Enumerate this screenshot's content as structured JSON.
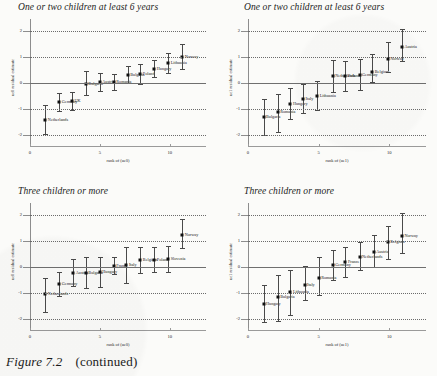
{
  "caption": {
    "figure": "Figure 7.2",
    "note": "(continued)"
  },
  "axis_defaults": {
    "y_ticks": [
      "2",
      "1",
      "0",
      "-1",
      "-2"
    ],
    "y_values": [
      2,
      1,
      0,
      -1,
      -2
    ],
    "x_ticks": [
      "0",
      "5",
      "10"
    ],
    "x_values": [
      0,
      5,
      10
    ]
  },
  "chart_data": [
    {
      "type": "scatter",
      "panel": "top-left",
      "title": "One or two children at least 6 years",
      "xlabel": "rank of (ue0)",
      "ylabel": "ue0 residual estimate",
      "xlim": [
        0,
        12.6
      ],
      "ylim": [
        -2.45,
        2.45
      ],
      "grid": true,
      "gridlines": [
        2,
        1,
        -1,
        -2
      ],
      "zero_line": 0,
      "points": [
        {
          "label": "Netherlands",
          "x": 1.1,
          "y": -1.42,
          "lo": -1.96,
          "hi": -0.86
        },
        {
          "label": "Germany",
          "x": 2.1,
          "y": -0.72,
          "lo": -1.07,
          "hi": -0.37
        },
        {
          "label": "UK",
          "x": 3.0,
          "y": -0.7,
          "lo": -1.03,
          "hi": -0.36
        },
        {
          "label": "Bulgaria",
          "x": 4.0,
          "y": -0.02,
          "lo": -0.47,
          "hi": 0.47
        },
        {
          "label": "Austria",
          "x": 5.0,
          "y": 0.02,
          "lo": -0.32,
          "hi": 0.37
        },
        {
          "label": "Romania",
          "x": 6.0,
          "y": 0.04,
          "lo": -0.26,
          "hi": 0.34
        },
        {
          "label": "Bulgaria2",
          "x": 7.0,
          "y": 0.32,
          "lo": 0.0,
          "hi": 0.66
        },
        {
          "label": "Poland",
          "x": 7.9,
          "y": 0.36,
          "lo": -0.02,
          "hi": 0.74
        },
        {
          "label": "Hungary",
          "x": 8.9,
          "y": 0.54,
          "lo": 0.22,
          "hi": 0.88
        },
        {
          "label": "Lithuania",
          "x": 9.9,
          "y": 0.78,
          "lo": 0.4,
          "hi": 1.16
        },
        {
          "label": "Norway",
          "x": 10.9,
          "y": 0.98,
          "lo": 0.52,
          "hi": 1.48
        }
      ]
    },
    {
      "type": "scatter",
      "panel": "top-right",
      "title": "One or two children at least 6 years",
      "xlabel": "rank of (ue1)",
      "ylabel": "ue1 residual estimate",
      "xlim": [
        0,
        12.6
      ],
      "ylim": [
        -2.45,
        2.45
      ],
      "grid": true,
      "gridlines": [
        2,
        1,
        -1,
        -2
      ],
      "zero_line": 0,
      "points": [
        {
          "label": "Bulgaria",
          "x": 1.1,
          "y": -1.32,
          "lo": -1.98,
          "hi": -0.62
        },
        {
          "label": "Romania",
          "x": 2.1,
          "y": -1.12,
          "lo": -1.86,
          "hi": -0.42
        },
        {
          "label": "Hungary",
          "x": 3.0,
          "y": -0.8,
          "lo": -1.38,
          "hi": -0.18
        },
        {
          "label": "Italy",
          "x": 3.9,
          "y": -0.62,
          "lo": -1.16,
          "hi": -0.04
        },
        {
          "label": "Lithuania",
          "x": 4.9,
          "y": -0.5,
          "lo": -1.04,
          "hi": 0.06
        },
        {
          "label": "Netherlands",
          "x": 6.0,
          "y": 0.26,
          "lo": -0.34,
          "hi": 0.88
        },
        {
          "label": "Poland",
          "x": 6.9,
          "y": 0.26,
          "lo": -0.32,
          "hi": 0.86
        },
        {
          "label": "Germany",
          "x": 7.9,
          "y": 0.3,
          "lo": -0.26,
          "hi": 0.92
        },
        {
          "label": "Belgium",
          "x": 8.8,
          "y": 0.42,
          "lo": 0.02,
          "hi": 1.12
        },
        {
          "label": "Norway",
          "x": 9.9,
          "y": 0.92,
          "lo": 0.44,
          "hi": 1.58
        },
        {
          "label": "Austria",
          "x": 10.9,
          "y": 1.36,
          "lo": 0.86,
          "hi": 2.06
        }
      ]
    },
    {
      "type": "scatter",
      "panel": "bottom-left",
      "title": "Three children or more",
      "xlabel": "rank of (ue0)",
      "ylabel": "ue0 residual estimate",
      "xlim": [
        0,
        12.6
      ],
      "ylim": [
        -2.45,
        2.45
      ],
      "grid": true,
      "gridlines": [
        2,
        1,
        -1,
        -2
      ],
      "zero_line": 0,
      "points": [
        {
          "label": "Netherlands",
          "x": 1.1,
          "y": -1.04,
          "lo": -1.72,
          "hi": -0.42
        },
        {
          "label": "Germany",
          "x": 2.1,
          "y": -0.66,
          "lo": -1.12,
          "hi": -0.2
        },
        {
          "label": "Austria",
          "x": 3.1,
          "y": -0.24,
          "lo": -0.74,
          "hi": 0.3
        },
        {
          "label": "Bulgaria",
          "x": 4.0,
          "y": -0.22,
          "lo": -0.82,
          "hi": 0.4
        },
        {
          "label": "Hungary",
          "x": 5.0,
          "y": -0.18,
          "lo": -0.76,
          "hi": 0.4
        },
        {
          "label": "France",
          "x": 6.0,
          "y": 0.04,
          "lo": -0.28,
          "hi": 0.38
        },
        {
          "label": "Italy",
          "x": 6.9,
          "y": 0.06,
          "lo": -0.62,
          "hi": 0.76
        },
        {
          "label": "Belgium",
          "x": 7.9,
          "y": 0.26,
          "lo": -0.22,
          "hi": 0.76
        },
        {
          "label": "Poland",
          "x": 8.9,
          "y": 0.28,
          "lo": -0.2,
          "hi": 0.78
        },
        {
          "label": "Slovenia",
          "x": 9.9,
          "y": 0.3,
          "lo": -0.18,
          "hi": 0.82
        },
        {
          "label": "Norway",
          "x": 10.9,
          "y": 1.22,
          "lo": 0.74,
          "hi": 1.82
        }
      ]
    },
    {
      "type": "scatter",
      "panel": "bottom-right",
      "title": "Three children or more",
      "xlabel": "rank of (ue1)",
      "ylabel": "ue1 residual estimate",
      "xlim": [
        0,
        12.6
      ],
      "ylim": [
        -2.45,
        2.45
      ],
      "grid": true,
      "gridlines": [
        2,
        1,
        -1,
        -2
      ],
      "zero_line": 0,
      "points": [
        {
          "label": "Hungary",
          "x": 1.1,
          "y": -1.42,
          "lo": -2.12,
          "hi": -0.7
        },
        {
          "label": "Bulgaria",
          "x": 2.1,
          "y": -1.16,
          "lo": -2.06,
          "hi": -0.3
        },
        {
          "label": "Lithuania",
          "x": 3.0,
          "y": -0.96,
          "lo": -1.84,
          "hi": -0.12
        },
        {
          "label": "Italy",
          "x": 4.0,
          "y": -0.7,
          "lo": -1.28,
          "hi": 0.02
        },
        {
          "label": "Romania",
          "x": 5.0,
          "y": -0.44,
          "lo": -1.08,
          "hi": 0.4
        },
        {
          "label": "Germany",
          "x": 6.0,
          "y": 0.08,
          "lo": -0.48,
          "hi": 0.64
        },
        {
          "label": "France",
          "x": 6.9,
          "y": 0.2,
          "lo": -0.38,
          "hi": 0.78
        },
        {
          "label": "Netherlands",
          "x": 7.9,
          "y": 0.4,
          "lo": -0.12,
          "hi": 0.96
        },
        {
          "label": "Austria",
          "x": 8.9,
          "y": 0.58,
          "lo": 0.0,
          "hi": 1.22
        },
        {
          "label": "Belgium",
          "x": 9.9,
          "y": 0.94,
          "lo": 0.3,
          "hi": 1.56
        },
        {
          "label": "Norway",
          "x": 10.9,
          "y": 1.2,
          "lo": 0.52,
          "hi": 2.06
        }
      ]
    }
  ]
}
